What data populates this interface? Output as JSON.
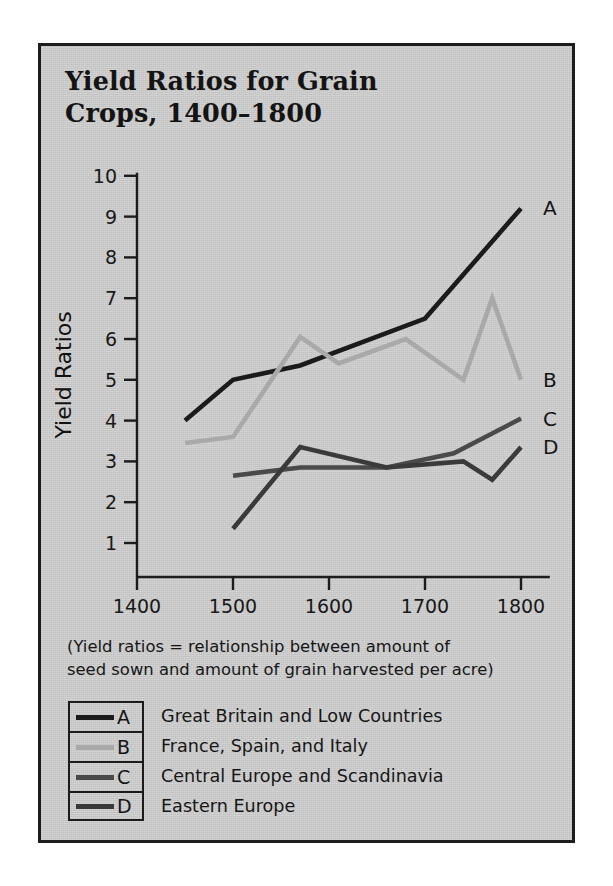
{
  "figure": {
    "title": "Yield Ratios for Grain Crops, 1400–1800",
    "title_line1": "Yield Ratios for Grain",
    "title_line2": "Crops, 1400–1800",
    "caption": "(Yield ratios = relationship between amount of seed sown and amount of grain harvested per acre)",
    "caption_line1": "(Yield ratios = relationship between amount of",
    "caption_line2": "seed sown and amount of grain harvested per acre)",
    "panel_color": "#c9c9c9",
    "frame_color": "#1d1d1d"
  },
  "legend": {
    "rows": [
      {
        "letter": "A",
        "label": "Great Britain and Low Countries",
        "color": "#1b1b1b"
      },
      {
        "letter": "B",
        "label": "France, Spain, and Italy",
        "color": "#a9a9a9"
      },
      {
        "letter": "C",
        "label": "Central Europe and Scandinavia",
        "color": "#4a4a4a"
      },
      {
        "letter": "D",
        "label": "Eastern Europe",
        "color": "#3a3a3a"
      }
    ]
  },
  "chart_data": {
    "type": "line",
    "title": "Yield Ratios for Grain Crops, 1400–1800",
    "xlabel": "",
    "ylabel": "Yield Ratios",
    "xlim": [
      1400,
      1810
    ],
    "ylim": [
      0,
      10.3
    ],
    "xticks": [
      1400,
      1500,
      1600,
      1700,
      1800
    ],
    "xtick_labels": [
      "1400",
      "1500",
      "1600",
      "1700",
      "1800"
    ],
    "yticks": [
      1,
      2,
      3,
      4,
      5,
      6,
      7,
      8,
      9,
      10
    ],
    "ytick_labels": [
      "1",
      "2",
      "3",
      "4",
      "5",
      "6",
      "7",
      "8",
      "9",
      "10"
    ],
    "grid": false,
    "legend_position": "below-plot",
    "series": [
      {
        "name": "A",
        "legend_label": "Great Britain and Low Countries",
        "color": "#1b1b1b",
        "end_tag": "A",
        "x": [
          1450,
          1500,
          1570,
          1700,
          1800
        ],
        "y": [
          4.0,
          5.0,
          5.35,
          6.5,
          9.2
        ]
      },
      {
        "name": "B",
        "legend_label": "France, Spain, and Italy",
        "color": "#a9a9a9",
        "end_tag": "B",
        "x": [
          1450,
          1500,
          1570,
          1610,
          1680,
          1740,
          1770,
          1800
        ],
        "y": [
          3.45,
          3.6,
          6.05,
          5.4,
          6.0,
          5.0,
          7.0,
          5.0
        ]
      },
      {
        "name": "C",
        "legend_label": "Central Europe and Scandinavia",
        "color": "#4a4a4a",
        "end_tag": "C",
        "x": [
          1500,
          1570,
          1660,
          1730,
          1800
        ],
        "y": [
          2.65,
          2.85,
          2.85,
          3.2,
          4.05
        ]
      },
      {
        "name": "D",
        "legend_label": "Eastern Europe",
        "color": "#3a3a3a",
        "end_tag": "D",
        "x": [
          1500,
          1570,
          1660,
          1740,
          1770,
          1800
        ],
        "y": [
          1.35,
          3.35,
          2.85,
          3.0,
          2.55,
          3.35
        ]
      }
    ]
  }
}
